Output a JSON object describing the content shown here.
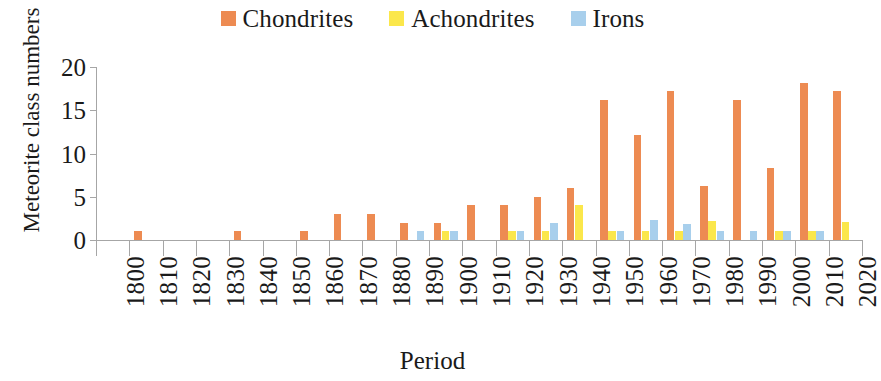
{
  "chart_data": {
    "type": "bar",
    "title": "",
    "xlabel": "Period",
    "ylabel": "Meteorite class numbers",
    "categories": [
      "1800",
      "1810",
      "1820",
      "1830",
      "1840",
      "1850",
      "1860",
      "1870",
      "1880",
      "1890",
      "1900",
      "1910",
      "1920",
      "1930",
      "1940",
      "1950",
      "1960",
      "1970",
      "1980",
      "1990",
      "2000",
      "2010",
      "2020"
    ],
    "series": [
      {
        "name": "Chondrites",
        "color": "#ED8B52",
        "values": [
          0,
          1,
          0,
          0,
          1,
          0,
          1,
          3,
          3,
          2,
          2,
          4,
          4,
          5,
          6,
          16.2,
          12.1,
          17.2,
          6.2,
          16.2,
          8.3,
          18.2,
          17.2
        ]
      },
      {
        "name": "Achondrites",
        "color": "#FBE74B",
        "values": [
          0,
          0,
          0,
          0,
          0,
          0,
          0,
          0,
          0,
          0,
          1,
          0,
          1,
          1,
          4,
          1,
          1,
          1,
          2.2,
          0,
          1,
          1,
          2.1
        ]
      },
      {
        "name": "Irons",
        "color": "#A8CFEC",
        "values": [
          0,
          0,
          0,
          0,
          0,
          0,
          0,
          0,
          0,
          1,
          1,
          0,
          1,
          2,
          0,
          1,
          2.3,
          1.8,
          1,
          1,
          1,
          1,
          0
        ]
      }
    ],
    "ylim": [
      0,
      20
    ],
    "yticks": [
      "0",
      "5",
      "10",
      "15",
      "20"
    ],
    "grid": false,
    "legend_position": "top-center"
  },
  "axes": {
    "y_title": "Meteorite class numbers",
    "x_title": "Period"
  },
  "legend": {
    "entries": [
      {
        "label": "Chondrites",
        "color": "#ED8B52"
      },
      {
        "label": "Achondrites",
        "color": "#FBE74B"
      },
      {
        "label": "Irons",
        "color": "#A8CFEC"
      }
    ]
  }
}
